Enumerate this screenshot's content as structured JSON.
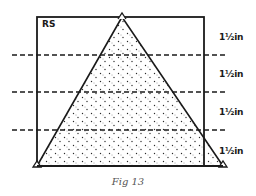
{
  "figure": {
    "box_label": "RS",
    "caption": "Fig 13",
    "section_labels": [
      "1½in",
      "1½in",
      "1½in",
      "1½in"
    ],
    "colors": {
      "stroke": "#1a1a1a",
      "dots": "#2a2a2a",
      "background": "#ffffff",
      "caption": "#555555"
    },
    "shape": "triangle-inside-rectangle",
    "sections": 4,
    "divider_style": "dashed"
  }
}
